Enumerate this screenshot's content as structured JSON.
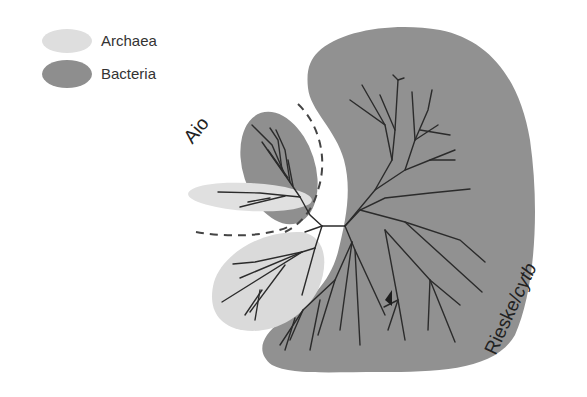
{
  "legend": {
    "items": [
      {
        "label": "Archaea",
        "color": "#d9d9d9"
      },
      {
        "label": "Bacteria",
        "color": "#8f8f8f"
      }
    ]
  },
  "clades": {
    "aio": {
      "label": "Aio",
      "rotation_deg": -50
    },
    "rieske": {
      "label_plain": "Rieske/",
      "label_italic": "cytb",
      "rotation_deg": -65
    }
  },
  "colors": {
    "archaea_fill": "#dcdcdc",
    "bacteria_fill": "#919191",
    "branch": "#2b2b2b",
    "dashed": "#444444",
    "background": "#ffffff"
  }
}
